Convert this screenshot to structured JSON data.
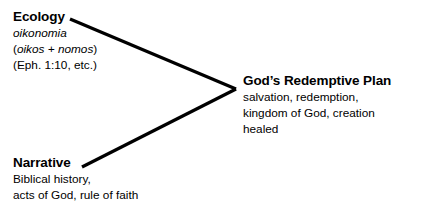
{
  "diagram": {
    "type": "convergence-diagram",
    "background_color": "#ffffff",
    "stroke_color": "#000000",
    "stroke_width": 3,
    "nodes": [
      {
        "id": "ecology",
        "heading": "Ecology",
        "lines": [
          {
            "text": "oikonomia",
            "style": "italic"
          },
          {
            "text": "(oikos + nomos)",
            "style": "italic-inner-parens"
          },
          {
            "text": "(Eph. 1:10, etc.)",
            "style": "regular"
          }
        ]
      },
      {
        "id": "narrative",
        "heading": "Narrative",
        "lines": [
          {
            "text": "Biblical history,",
            "style": "regular"
          },
          {
            "text": "acts of God, rule of faith",
            "style": "regular"
          }
        ]
      },
      {
        "id": "redemptive-plan",
        "heading": "God’s Redemptive Plan",
        "lines": [
          {
            "text": "salvation, redemption,",
            "style": "regular"
          },
          {
            "text": "kingdom of God, creation",
            "style": "regular"
          },
          {
            "text": "healed",
            "style": "regular"
          }
        ]
      }
    ],
    "connectors": [
      {
        "id": "ecology-to-plan",
        "from": "ecology",
        "to": "redemptive-plan",
        "x1": 70,
        "y1": 19,
        "x2": 236,
        "y2": 89
      },
      {
        "id": "narrative-to-plan",
        "from": "narrative",
        "to": "redemptive-plan",
        "x1": 82,
        "y1": 167,
        "x2": 236,
        "y2": 89
      }
    ]
  },
  "ecology": {
    "heading": "Ecology",
    "line_1": "oikonomia",
    "line_2_open_paren": "(",
    "line_2_italic": "oikos + nomos",
    "line_2_close_paren": ")",
    "line_3": "(Eph. 1:10, etc.)"
  },
  "narrative": {
    "heading": "Narrative",
    "line_1": "Biblical history,",
    "line_2": "acts of God, rule of faith"
  },
  "plan": {
    "heading": "God’s Redemptive Plan",
    "line_1": "salvation, redemption,",
    "line_2": "kingdom of God, creation",
    "line_3": "healed"
  }
}
